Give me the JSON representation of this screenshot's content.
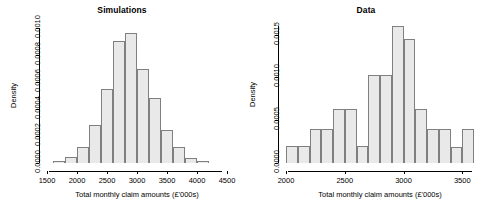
{
  "chart_data": [
    {
      "panel": "left",
      "type": "bar",
      "title": "Simulations",
      "xlabel": "Total monthly claim amounts (£'000s)",
      "ylabel": "Density",
      "xlim": [
        1500,
        4500
      ],
      "ylim": [
        0.0,
        0.001
      ],
      "xticks": [
        1500,
        2000,
        2500,
        3000,
        3500,
        4000,
        4500
      ],
      "xtick_labels": [
        "1500",
        "2000",
        "2500",
        "3000",
        "3500",
        "4000",
        "4500"
      ],
      "yticks": [
        0.0,
        0.0002,
        0.0004,
        0.0006,
        0.0008,
        0.001
      ],
      "ytick_labels": [
        "0.0000",
        "0.0002",
        "0.0004",
        "0.0006",
        "0.0008",
        "0.0010"
      ],
      "grid": false,
      "legend": false,
      "bin_width": 200,
      "bin_edges": [
        1600,
        1800,
        2000,
        2200,
        2400,
        2600,
        2800,
        3000,
        3200,
        3400,
        3600,
        3800,
        4000,
        4200
      ],
      "bin_labels": [
        "1600-1800",
        "1800-2000",
        "2000-2200",
        "2200-2400",
        "2400-2600",
        "2600-2800",
        "2800-3000",
        "3000-3200",
        "3200-3400",
        "3400-3600",
        "3600-3800",
        "3800-4000",
        "4000-4200"
      ],
      "values": [
        1.5e-05,
        4.5e-05,
        0.00012,
        0.000285,
        0.000545,
        0.000905,
        0.00096,
        0.000695,
        0.00048,
        0.000245,
        0.000115,
        3.5e-05,
        1.2e-05
      ]
    },
    {
      "panel": "right",
      "type": "bar",
      "title": "Data",
      "xlabel": "Total monthly claim amounts (£'000s)",
      "ylabel": "Density",
      "xlim": [
        2000,
        3600
      ],
      "ylim": [
        0.0,
        0.0016
      ],
      "xticks": [
        2000,
        2500,
        3000,
        3500
      ],
      "xtick_labels": [
        "2000",
        "2500",
        "3000",
        "3500"
      ],
      "yticks": [
        0.0,
        0.0005,
        0.001,
        0.0015
      ],
      "ytick_labels": [
        "0.0000",
        "0.0005",
        "0.0010",
        "0.0015"
      ],
      "grid": false,
      "legend": false,
      "bin_width": 100,
      "bin_edges": [
        2000,
        2100,
        2200,
        2300,
        2400,
        2500,
        2600,
        2700,
        2800,
        2900,
        3000,
        3100,
        3200,
        3300,
        3400,
        3500,
        3600
      ],
      "bin_labels": [
        "2000-2100",
        "2100-2200",
        "2200-2300",
        "2300-2400",
        "2400-2500",
        "2500-2600",
        "2600-2700",
        "2700-2800",
        "2800-2900",
        "2900-3000",
        "3000-3100",
        "3100-3200",
        "3200-3300",
        "3300-3400",
        "3400-3500",
        "3500-3600"
      ],
      "values": [
        0.0002,
        0.0002,
        0.0004,
        0.0004,
        0.000625,
        0.000625,
        0.0002,
        0.001025,
        0.001025,
        0.0016,
        0.00145,
        0.000625,
        0.0004,
        0.0004,
        0.00019,
        0.0004
      ]
    }
  ]
}
